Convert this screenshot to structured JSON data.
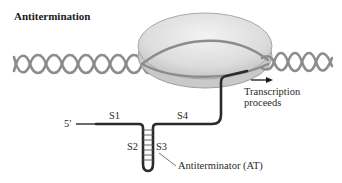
{
  "title": "Antitermination",
  "labels": {
    "five_prime": "5′",
    "s1": "S1",
    "s2": "S2",
    "s3": "S3",
    "s4": "S4",
    "antiterminator": "Antiterminator (AT)",
    "transcription_line1": "Transcription",
    "transcription_line2": "proceeds"
  },
  "colors": {
    "dna": "#8c8c8c",
    "polymerase_fill": "#d9d9d9",
    "polymerase_edge": "#a8a8a8",
    "rna": "#2b2b2b",
    "text": "#222222"
  }
}
